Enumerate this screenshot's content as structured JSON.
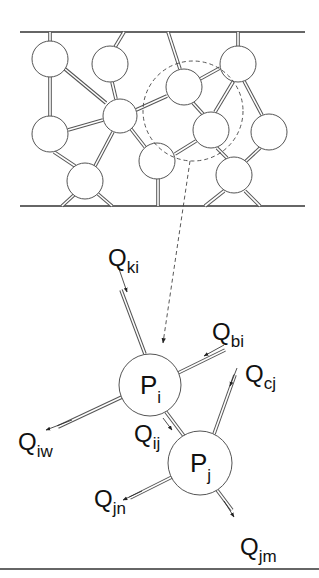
{
  "figure": {
    "network": {
      "top_wall_y": 32,
      "bottom_wall_y": 206,
      "wall_x": [
        20,
        305
      ],
      "pores": [
        {
          "x": 50,
          "y": 59,
          "r": 18
        },
        {
          "x": 110,
          "y": 64,
          "r": 18
        },
        {
          "x": 120,
          "y": 116,
          "r": 17
        },
        {
          "x": 50,
          "y": 134,
          "r": 18
        },
        {
          "x": 85,
          "y": 181,
          "r": 18
        },
        {
          "x": 184,
          "y": 87,
          "r": 18
        },
        {
          "x": 238,
          "y": 64,
          "r": 18
        },
        {
          "x": 211,
          "y": 130,
          "r": 18
        },
        {
          "x": 269,
          "y": 132,
          "r": 18
        },
        {
          "x": 157,
          "y": 161,
          "r": 18
        },
        {
          "x": 234,
          "y": 175,
          "r": 18
        }
      ],
      "throats": [
        [
          50,
          32,
          50,
          41
        ],
        [
          50,
          77,
          50,
          116
        ],
        [
          65,
          69,
          106,
          103
        ],
        [
          124,
          32,
          115,
          47
        ],
        [
          112,
          82,
          116,
          99
        ],
        [
          68,
          130,
          103,
          120
        ],
        [
          136,
          110,
          167,
          96
        ],
        [
          113,
          132,
          95,
          166
        ],
        [
          54,
          152,
          75,
          166
        ],
        [
          74,
          195,
          62,
          206
        ],
        [
          98,
          194,
          112,
          206
        ],
        [
          168,
          32,
          180,
          69
        ],
        [
          200,
          79,
          220,
          68
        ],
        [
          193,
          103,
          203,
          114
        ],
        [
          131,
          129,
          145,
          147
        ],
        [
          175,
          154,
          196,
          141
        ],
        [
          158,
          179,
          158,
          206
        ],
        [
          238,
          32,
          238,
          46
        ],
        [
          233,
          82,
          215,
          112
        ],
        [
          244,
          81,
          262,
          115
        ],
        [
          217,
          148,
          227,
          158
        ],
        [
          260,
          148,
          245,
          162
        ],
        [
          224,
          191,
          205,
          206
        ],
        [
          245,
          191,
          260,
          206
        ]
      ],
      "highlight_circle": {
        "cx": 193,
        "cy": 111,
        "r": 50
      }
    },
    "callout_line": {
      "from": [
        190,
        161
      ],
      "to": [
        163,
        343
      ]
    },
    "pores_detail": [
      {
        "id": "Pi",
        "label_main": "P",
        "label_sub": "i",
        "cx": 150,
        "cy": 385,
        "r": 31
      },
      {
        "id": "Pj",
        "label_main": "P",
        "label_sub": "j",
        "cx": 200,
        "cy": 463,
        "r": 32
      }
    ],
    "flows": [
      {
        "id": "Qki",
        "main": "Q",
        "sub": "ki",
        "lx": 108,
        "ly": 266,
        "throat": [
          145,
          354,
          121,
          290
        ],
        "arrow": [
          118,
          266,
          127,
          292
        ]
      },
      {
        "id": "Qbi",
        "main": "Q",
        "sub": "bi",
        "lx": 212,
        "ly": 340,
        "throat": [
          178,
          373,
          225,
          350
        ],
        "arrow": [
          224,
          345,
          204,
          356
        ]
      },
      {
        "id": "Qcj",
        "main": "Q",
        "sub": "cj",
        "lx": 245,
        "ly": 382,
        "throat": [
          214,
          434,
          235,
          375
        ],
        "arrow": [
          237,
          368,
          230,
          386
        ]
      },
      {
        "id": "Qiw",
        "main": "Q",
        "sub": "iw",
        "lx": 18,
        "ly": 450,
        "throat": [
          122,
          397,
          58,
          427
        ],
        "arrow": [
          72,
          420,
          46,
          430
        ]
      },
      {
        "id": "Qij",
        "main": "Q",
        "sub": "ij",
        "lx": 134,
        "ly": 442,
        "throat": [
          166,
          412,
          184,
          436
        ],
        "arrow": [
          163,
          418,
          172,
          430
        ]
      },
      {
        "id": "Qjn",
        "main": "Q",
        "sub": "jn",
        "lx": 94,
        "ly": 507,
        "throat": [
          172,
          477,
          130,
          498
        ],
        "arrow": [
          142,
          491,
          123,
          500
        ]
      },
      {
        "id": "Qjm",
        "main": "Q",
        "sub": "jm",
        "lx": 240,
        "ly": 555,
        "throat": [
          217,
          490,
          232,
          510
        ],
        "arrow": [
          224,
          501,
          234,
          517
        ]
      }
    ],
    "bottom_rule_y": 569
  }
}
